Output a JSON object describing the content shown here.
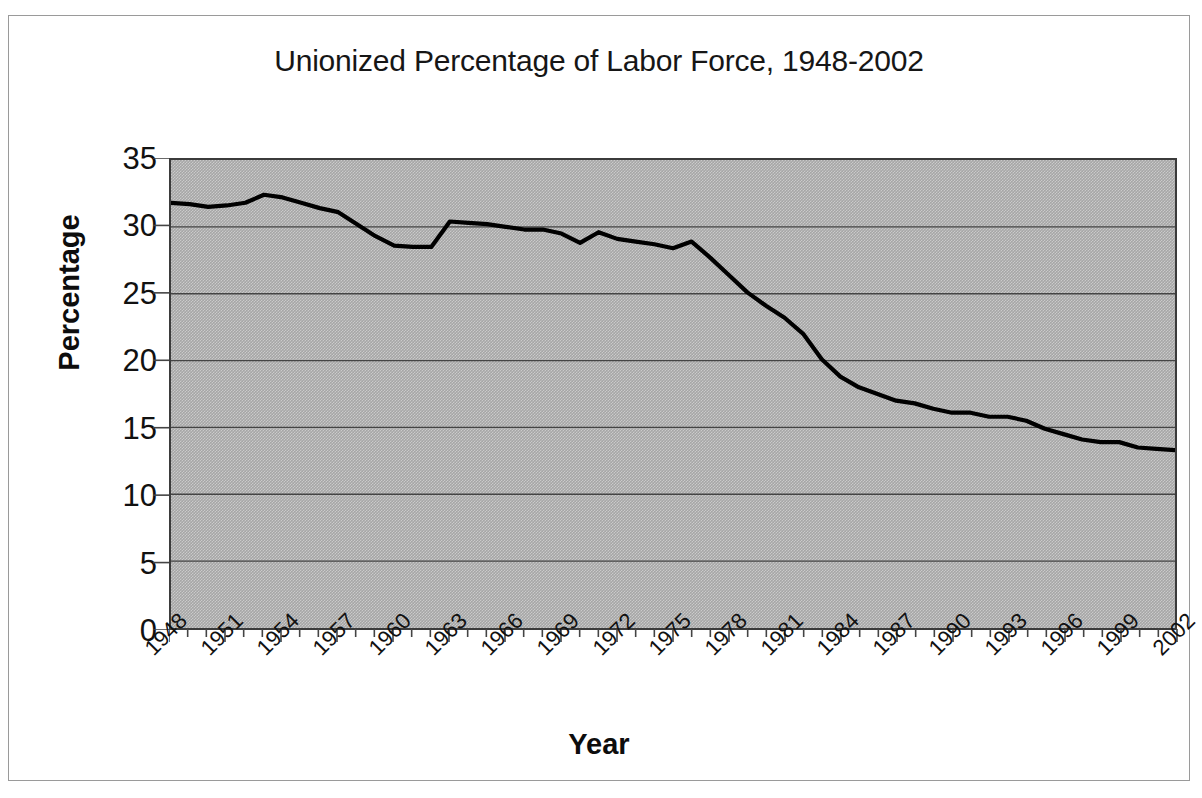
{
  "chart_data": {
    "type": "line",
    "title": "Unionized Percentage of Labor Force, 1948-2002",
    "xlabel": "Year",
    "ylabel": "Percentage",
    "ylim": [
      0,
      35
    ],
    "ytick_step": 5,
    "yticks": [
      "35",
      "30",
      "25",
      "20",
      "15",
      "10",
      "5",
      "0"
    ],
    "xlim": [
      1948,
      2002
    ],
    "xtick_step": 3,
    "xticks": [
      "1948",
      "1951",
      "1954",
      "1957",
      "1960",
      "1963",
      "1966",
      "1969",
      "1972",
      "1975",
      "1978",
      "1981",
      "1984",
      "1987",
      "1990",
      "1993",
      "1996",
      "1999",
      "2002"
    ],
    "grid": "horizontal",
    "legend": "none",
    "plot_background_color": "#a6a6a6",
    "line_color": "#000000",
    "border_color": "#3b3b3b",
    "x": [
      1948,
      1949,
      1950,
      1951,
      1952,
      1953,
      1954,
      1955,
      1956,
      1957,
      1958,
      1959,
      1960,
      1961,
      1962,
      1963,
      1964,
      1965,
      1966,
      1967,
      1968,
      1969,
      1970,
      1971,
      1972,
      1973,
      1974,
      1975,
      1976,
      1977,
      1978,
      1979,
      1980,
      1981,
      1982,
      1983,
      1984,
      1985,
      1986,
      1987,
      1988,
      1989,
      1990,
      1991,
      1992,
      1993,
      1994,
      1995,
      1996,
      1997,
      1998,
      1999,
      2000,
      2001,
      2002
    ],
    "values": [
      31.8,
      31.7,
      31.5,
      31.6,
      31.8,
      32.4,
      32.2,
      31.8,
      31.4,
      31.1,
      30.2,
      29.3,
      28.6,
      28.5,
      28.5,
      30.4,
      30.3,
      30.2,
      30.0,
      29.8,
      29.8,
      29.5,
      28.8,
      29.6,
      29.1,
      28.9,
      28.7,
      28.4,
      28.9,
      27.7,
      26.4,
      25.1,
      24.1,
      23.2,
      22.0,
      20.1,
      18.8,
      18.0,
      17.5,
      17.0,
      16.8,
      16.4,
      16.1,
      16.1,
      15.8,
      15.8,
      15.5,
      14.9,
      14.5,
      14.1,
      13.9,
      13.9,
      13.5,
      13.4,
      13.3
    ]
  }
}
